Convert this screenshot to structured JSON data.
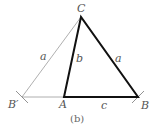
{
  "figure": {
    "caption": "(b)",
    "vertices": {
      "C": {
        "label": "C",
        "x": 81,
        "y": 17
      },
      "A": {
        "label": "A",
        "x": 64,
        "y": 97
      },
      "B": {
        "label": "B",
        "x": 138,
        "y": 97
      },
      "B_prime": {
        "label": "B′",
        "x": 22,
        "y": 97
      }
    },
    "sides": {
      "a_left": "a",
      "b": "b",
      "a_right": "a",
      "c": "c"
    },
    "colors": {
      "thick_line": "#111111",
      "thin_line": "#888888",
      "label": "#555555"
    }
  }
}
